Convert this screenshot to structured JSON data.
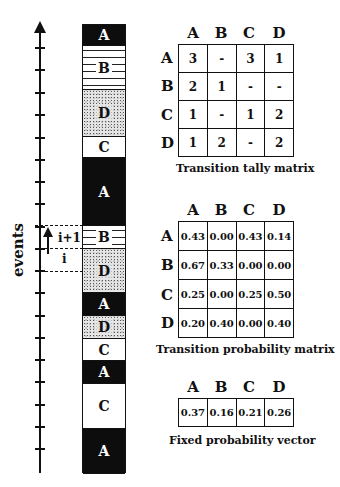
{
  "axis": {
    "label": "events",
    "ticks_y": [
      47,
      69,
      92,
      114,
      137,
      159,
      181,
      203,
      226,
      248,
      270,
      292,
      315,
      337,
      359,
      381,
      404,
      426,
      448
    ]
  },
  "column": {
    "segments": [
      {
        "state": "A",
        "top": 0,
        "height": 21
      },
      {
        "state": "B",
        "top": 21,
        "height": 44
      },
      {
        "state": "D",
        "top": 65,
        "height": 47
      },
      {
        "state": "C",
        "top": 112,
        "height": 21
      },
      {
        "state": "A",
        "top": 133,
        "height": 68
      },
      {
        "state": "B",
        "top": 201,
        "height": 23
      },
      {
        "state": "D",
        "top": 224,
        "height": 44
      },
      {
        "state": "A",
        "top": 268,
        "height": 23
      },
      {
        "state": "D",
        "top": 291,
        "height": 23
      },
      {
        "state": "C",
        "top": 314,
        "height": 22
      },
      {
        "state": "A",
        "top": 336,
        "height": 23
      },
      {
        "state": "C",
        "top": 359,
        "height": 45
      },
      {
        "state": "A",
        "top": 404,
        "height": 45
      }
    ]
  },
  "event_marker": {
    "upper_label": "i+1",
    "lower_label": "i"
  },
  "tally_matrix": {
    "column_headers": [
      "A",
      "B",
      "C",
      "D"
    ],
    "row_headers": [
      "A",
      "B",
      "C",
      "D"
    ],
    "rows": [
      [
        "3",
        "-",
        "3",
        "1"
      ],
      [
        "2",
        "1",
        "-",
        "-"
      ],
      [
        "1",
        "-",
        "1",
        "2"
      ],
      [
        "1",
        "2",
        "-",
        "2"
      ]
    ],
    "caption": "Transition tally matrix"
  },
  "probability_matrix": {
    "column_headers": [
      "A",
      "B",
      "C",
      "D"
    ],
    "row_headers": [
      "A",
      "B",
      "C",
      "D"
    ],
    "rows": [
      [
        "0.43",
        "0.00",
        "0.43",
        "0.14"
      ],
      [
        "0.67",
        "0.33",
        "0.00",
        "0.00"
      ],
      [
        "0.25",
        "0.00",
        "0.25",
        "0.50"
      ],
      [
        "0.20",
        "0.40",
        "0.00",
        "0.40"
      ]
    ],
    "caption": "Transition probability matrix"
  },
  "fixed_vector": {
    "column_headers": [
      "A",
      "B",
      "C",
      "D"
    ],
    "values": [
      "0.37",
      "0.16",
      "0.21",
      "0.26"
    ],
    "caption": "Fixed probability vector"
  }
}
